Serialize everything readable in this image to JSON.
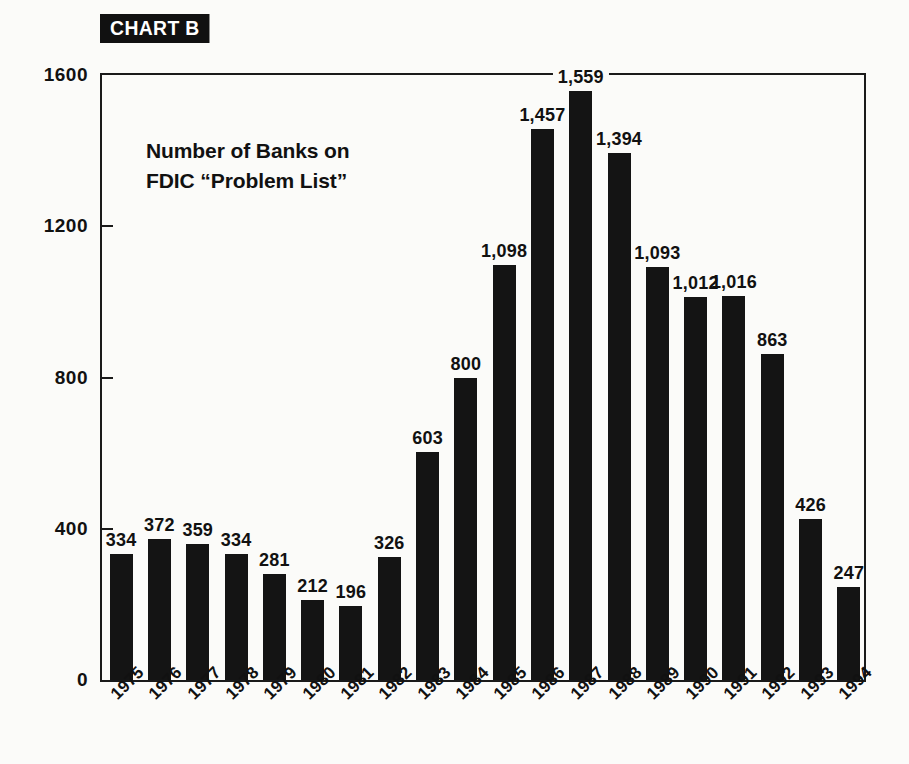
{
  "badge": {
    "label": "CHART B"
  },
  "title": {
    "line1": "Number of Banks on",
    "line2": "FDIC “Problem List”"
  },
  "colors": {
    "bar": "#141414",
    "axis": "#1a1a1a",
    "text": "#111111",
    "background": "#fbfbf9",
    "badge_background": "#111111",
    "badge_text": "#ffffff"
  },
  "chart_data": {
    "type": "bar",
    "title": "Number of Banks on FDIC “Problem List”",
    "subtitle": "CHART B",
    "xlabel": "",
    "ylabel": "",
    "ylim": [
      0,
      1600
    ],
    "yticks": [
      0,
      400,
      800,
      1200,
      1600
    ],
    "ytick_labels": [
      "0",
      "400",
      "800",
      "1200",
      "1600"
    ],
    "grid": false,
    "legend": "none",
    "categories": [
      "1975",
      "1976",
      "1977",
      "1978",
      "1979",
      "1980",
      "1981",
      "1982",
      "1983",
      "1984",
      "1985",
      "1986",
      "1987",
      "1988",
      "1989",
      "1990",
      "1991",
      "1992",
      "1993",
      "1994"
    ],
    "values": [
      334,
      372,
      359,
      334,
      281,
      212,
      196,
      326,
      603,
      800,
      1098,
      1457,
      1559,
      1394,
      1093,
      1012,
      1016,
      863,
      426,
      247
    ],
    "value_labels": [
      "334",
      "372",
      "359",
      "334",
      "281",
      "212",
      "196",
      "326",
      "603",
      "800",
      "1,098",
      "1,457",
      "1,559",
      "1,394",
      "1,093",
      "1,012",
      "1,016",
      "863",
      "426",
      "247"
    ]
  }
}
